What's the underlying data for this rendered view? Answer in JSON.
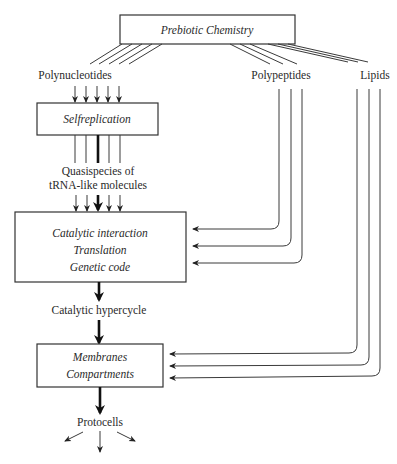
{
  "diagram": {
    "title": "Prebiotic Chemistry",
    "boxes": {
      "prebiotic": {
        "lines": [
          "Prebiotic Chemistry"
        ]
      },
      "selfreplication": {
        "lines": [
          "Selfreplication"
        ]
      },
      "catalytic": {
        "lines": [
          "Catalytic interaction",
          "Translation",
          "Genetic code"
        ]
      },
      "membranes": {
        "lines": [
          "Membranes",
          "Compartments"
        ]
      }
    },
    "labels": {
      "polynucleotides": "Polynucleotides",
      "polypeptides": "Polypeptides",
      "lipids": "Lipids",
      "quasispecies_1": "Quasispecies of",
      "quasispecies_2": "tRNA-like molecules",
      "hypercycle": "Catalytic hypercycle",
      "protocells": "Protocells"
    },
    "colors": {
      "stroke": "#333333",
      "text": "#2a2a2a",
      "background": "#ffffff"
    }
  }
}
